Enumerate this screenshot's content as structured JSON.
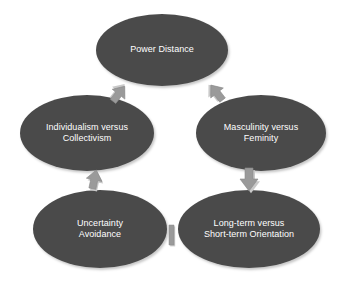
{
  "diagram": {
    "type": "cycle-diagram",
    "colors": {
      "node_fill": "#4a4a4a",
      "node_text": "#ffffff",
      "arrow_fill": "#9a9a9a",
      "arrow_shadow": "#c8c8c8",
      "background": "#ffffff"
    },
    "nodes": [
      {
        "id": "power-distance",
        "label": "Power Distance",
        "lines": [
          "Power Distance"
        ],
        "position": "top"
      },
      {
        "id": "individualism-collectivism",
        "label": "Individualism versus Collectivism",
        "lines": [
          "Individualism versus",
          "Collectivism"
        ],
        "position": "upper-left"
      },
      {
        "id": "masculinity-feminity",
        "label": "Masculinity versus Feminity",
        "lines": [
          "Masculinity versus",
          "Feminity"
        ],
        "position": "upper-right"
      },
      {
        "id": "uncertainty-avoidance",
        "label": "Uncertainty Avoidance",
        "lines": [
          "Uncertainty",
          "Avoidance"
        ],
        "position": "lower-left"
      },
      {
        "id": "longterm-shortterm-orientation",
        "label": "Long-term versus Short-term Orientation",
        "lines": [
          "Long-term versus",
          "Short-term Orientation"
        ],
        "position": "lower-right"
      }
    ],
    "arrows": [
      {
        "id": "power-to-individualism",
        "from": "power-distance",
        "to": "individualism-collectivism",
        "direction": "down-left"
      },
      {
        "id": "power-to-masculinity",
        "from": "power-distance",
        "to": "masculinity-feminity",
        "direction": "down-right"
      },
      {
        "id": "masculinity-to-longterm",
        "from": "masculinity-feminity",
        "to": "longterm-shortterm-orientation",
        "direction": "down"
      },
      {
        "id": "longterm-to-uncertainty",
        "from": "longterm-shortterm-orientation",
        "to": "uncertainty-avoidance",
        "direction": "left"
      },
      {
        "id": "uncertainty-to-individualism",
        "from": "uncertainty-avoidance",
        "to": "individualism-collectivism",
        "direction": "up"
      }
    ]
  }
}
